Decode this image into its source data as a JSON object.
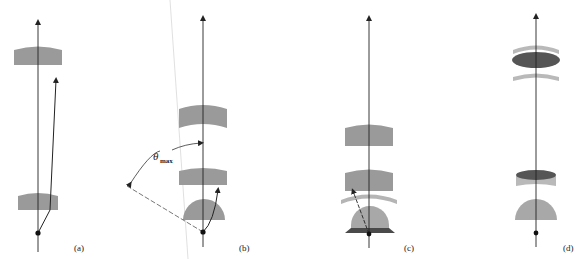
{
  "figure": {
    "colors": {
      "lens_gray": "#9a9a9a",
      "lens_light": "#b9b9b9",
      "lens_dark": "#555555",
      "immersion_dark": "#4a4a4a",
      "line": "#222222",
      "guide_line": "#d8d8d8"
    },
    "panels": [
      {
        "id": "a",
        "label": "(a)"
      },
      {
        "id": "b",
        "label": "(b)",
        "angle_label": "θ",
        "angle_sub": "max"
      },
      {
        "id": "c",
        "label": "(c)"
      },
      {
        "id": "d",
        "label": "(d)"
      }
    ]
  }
}
